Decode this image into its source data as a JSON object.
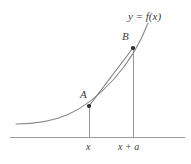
{
  "figure": {
    "background_color": "#ffffff",
    "curve_color": "#8a8a8a",
    "axis_color": "#9a9a9a",
    "chord_color": "#7d7d7d",
    "ordinate_color": "#9a9a9a",
    "point_color": "#2b2b2b",
    "label_color": "#3a3a3a",
    "labels": {
      "point_a": "A",
      "point_b": "B",
      "curve": "y = f(x)",
      "tick_x": "x",
      "tick_x_plus_a": "x + a"
    },
    "geometry": {
      "axis": {
        "x1": 10,
        "y1": 137,
        "x2": 185,
        "y2": 137
      },
      "point_a": {
        "x": 89,
        "y": 106
      },
      "point_b": {
        "x": 133,
        "y": 48
      },
      "ordinate_a": {
        "x": 89,
        "y_top": 106,
        "y_bottom": 137
      },
      "ordinate_b": {
        "x": 133,
        "y_top": 48,
        "y_bottom": 137
      },
      "curve_path": "M 16 124 C 34 124 52 121 68 114 C 84 107 100 94 114 79 C 126 66 138 48 148 23",
      "chord_path": "M 89 106 L 133 48"
    }
  }
}
